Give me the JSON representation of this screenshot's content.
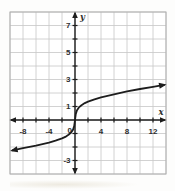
{
  "figure": {
    "kind": "coordinate-plane-graph"
  },
  "chart_data": {
    "type": "line",
    "title": "",
    "xlabel": "x",
    "ylabel": "y",
    "origin_label": "0",
    "x_range": [
      -10,
      14
    ],
    "y_range": [
      -4,
      8
    ],
    "x_grid_step": 2,
    "y_grid_step": 1,
    "x_tick_step": 2,
    "y_tick_step": 1,
    "x_tick_labels": [
      {
        "value": -8,
        "label": "-8"
      },
      {
        "value": -4,
        "label": "-4"
      },
      {
        "value": 4,
        "label": "4"
      },
      {
        "value": 8,
        "label": "8"
      },
      {
        "value": 12,
        "label": "12"
      }
    ],
    "y_tick_labels": [
      {
        "value": -3,
        "label": "-3"
      },
      {
        "value": 1,
        "label": "1"
      },
      {
        "value": 3,
        "label": "3"
      },
      {
        "value": 5,
        "label": "5"
      },
      {
        "value": 7,
        "label": "7"
      }
    ],
    "series": [
      {
        "name": "cube-root-curve",
        "arrow_both_ends": true,
        "points": [
          [
            -9.6,
            -2.25
          ],
          [
            -8,
            -2.08
          ],
          [
            -6,
            -1.9
          ],
          [
            -4,
            -1.68
          ],
          [
            -3,
            -1.53
          ],
          [
            -2,
            -1.36
          ],
          [
            -1.5,
            -1.25
          ],
          [
            -1,
            -1.1
          ],
          [
            -0.6,
            -0.93
          ],
          [
            -0.3,
            -0.72
          ],
          [
            -0.12,
            -0.45
          ],
          [
            0,
            0
          ],
          [
            0.12,
            0.45
          ],
          [
            0.3,
            0.72
          ],
          [
            0.6,
            0.93
          ],
          [
            1,
            1.1
          ],
          [
            1.5,
            1.25
          ],
          [
            2,
            1.36
          ],
          [
            3,
            1.53
          ],
          [
            4,
            1.68
          ],
          [
            6,
            1.9
          ],
          [
            8,
            2.12
          ],
          [
            10,
            2.3
          ],
          [
            12,
            2.45
          ],
          [
            13.7,
            2.6
          ]
        ]
      }
    ],
    "colors": {
      "background": "#ffffff",
      "grid": "#c7c7c7",
      "border": "#b0b0b0",
      "axis": "#1d1d1d",
      "curve": "#1d1d1d",
      "label": "#2e2e2e"
    }
  }
}
